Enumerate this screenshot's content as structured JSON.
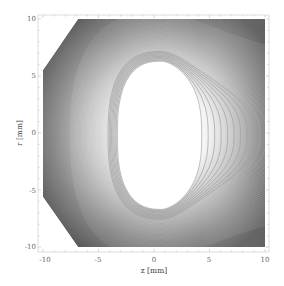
{
  "chart_data": {
    "type": "contour",
    "title": "",
    "xlabel": "z [mm]",
    "ylabel": "r [mm]",
    "xlim": [
      -10,
      10
    ],
    "ylim": [
      -10,
      10
    ],
    "x_ticks": [
      -10,
      -5,
      0,
      5,
      10
    ],
    "y_ticks": [
      -10,
      -5,
      0,
      5,
      10
    ],
    "x_tick_labels": [
      "-10",
      "-5",
      "0",
      "5",
      "10"
    ],
    "y_tick_labels": [
      "-10",
      "-5",
      "0",
      "5",
      "10"
    ],
    "grid": false,
    "legend": null,
    "colormap": "grayscale (dark at domain corners, white at center)",
    "domain_shape": "square with left corners chamfered (octagon-like on left side)",
    "domain_polygon": [
      [
        -6.8,
        10
      ],
      [
        10,
        10
      ],
      [
        10,
        -10
      ],
      [
        -6.8,
        -10
      ],
      [
        -10,
        -5.5
      ],
      [
        -10,
        5.5
      ]
    ],
    "central_region": {
      "description": "white lobe-shaped region, flat near left, pointed toward +z",
      "z_range": [
        -3.3,
        4.3
      ],
      "r_range": [
        -6.8,
        6.3
      ],
      "center": [
        0.7,
        -0.2
      ]
    },
    "visible_contour_lines_outside_lobe": 8,
    "colors": {
      "dark": "#5a5a5a",
      "mid": "#a8a8a8",
      "light": "#ffffff",
      "contour_line": "#9a9a9a"
    }
  }
}
